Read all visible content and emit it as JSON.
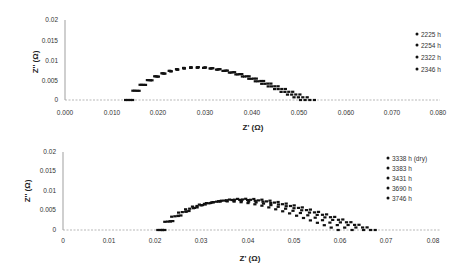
{
  "chart_data": [
    {
      "type": "scatter",
      "title": "",
      "xlabel": "Z' (Ω)",
      "ylabel": "Z'' (Ω)",
      "xlim": [
        0,
        0.08
      ],
      "ylim": [
        0,
        0.02
      ],
      "x_ticks": [
        "0.000",
        "0.010",
        "0.020",
        "0.030",
        "0.040",
        "0.050",
        "0.060",
        "0.070",
        "0.080"
      ],
      "y_ticks": [
        "0",
        "0.005",
        "0.01",
        "0.015",
        "0.02"
      ],
      "grid": false,
      "legend_position": "right",
      "series": [
        {
          "name": "2225 h",
          "x_start": 0.0145,
          "x_end": 0.0505,
          "peak": 0.0086
        },
        {
          "name": "2254 h",
          "x_start": 0.014,
          "x_end": 0.0515,
          "peak": 0.0086
        },
        {
          "name": "2322 h",
          "x_start": 0.0135,
          "x_end": 0.0525,
          "peak": 0.0087
        },
        {
          "name": "2346 h",
          "x_start": 0.013,
          "x_end": 0.0535,
          "peak": 0.0087
        }
      ]
    },
    {
      "type": "scatter",
      "title": "",
      "xlabel": "Z' (Ω)",
      "ylabel": "Z'' (Ω)",
      "xlim": [
        0,
        0.08
      ],
      "ylim": [
        0,
        0.02
      ],
      "x_ticks": [
        "0",
        "0.01",
        "0.02",
        "0.03",
        "0.04",
        "0.05",
        "0.06",
        "0.07",
        "0.08"
      ],
      "y_ticks": [
        "0",
        "0.005",
        "0.01",
        "0.015",
        "0.02"
      ],
      "grid": false,
      "legend_position": "right",
      "series": [
        {
          "name": "3338 h (dry)",
          "x_start": 0.0205,
          "x_end": 0.0595,
          "peak": 0.0078
        },
        {
          "name": "3383 h",
          "x_start": 0.021,
          "x_end": 0.0625,
          "peak": 0.008
        },
        {
          "name": "3431 h",
          "x_start": 0.0215,
          "x_end": 0.065,
          "peak": 0.0082
        },
        {
          "name": "3690 h",
          "x_start": 0.0215,
          "x_end": 0.0665,
          "peak": 0.0083
        },
        {
          "name": "3746 h",
          "x_start": 0.022,
          "x_end": 0.0675,
          "peak": 0.0085
        }
      ]
    }
  ],
  "plots": [
    {
      "ylabel": "Z'' (Ω)",
      "xlabel": "Z' (Ω)",
      "x_ticks": [
        "0.000",
        "0.010",
        "0.020",
        "0.030",
        "0.040",
        "0.050",
        "0.060",
        "0.070",
        "0.080"
      ],
      "y_ticks": [
        "0",
        "0.005",
        "0.01",
        "0.015",
        "0.02"
      ],
      "legend": [
        "2225 h",
        "2254 h",
        "2322 h",
        "2346 h"
      ]
    },
    {
      "ylabel": "Z'' (Ω)",
      "xlabel": "Z' (Ω)",
      "x_ticks": [
        "0",
        "0.01",
        "0.02",
        "0.03",
        "0.04",
        "0.05",
        "0.06",
        "0.07",
        "0.08"
      ],
      "y_ticks": [
        "0",
        "0.005",
        "0.01",
        "0.015",
        "0.02"
      ],
      "legend": [
        "3338 h (dry)",
        "3383 h",
        "3431 h",
        "3690 h",
        "3746 h"
      ]
    }
  ],
  "colors": {
    "marker": "#111111",
    "axis": "#999999",
    "text": "#333333"
  }
}
